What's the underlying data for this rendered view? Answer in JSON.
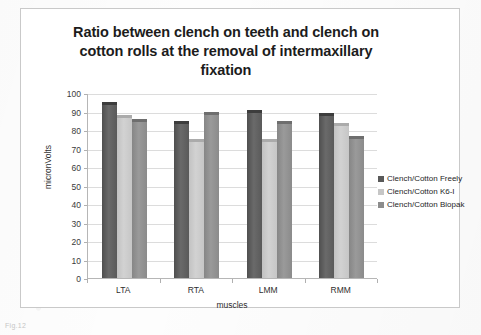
{
  "figure": {
    "caption": "Fig.12"
  },
  "chart_data": {
    "type": "bar",
    "title": "Ratio between clench on teeth and clench on cotton rolls at the removal of intermaxillary fixation",
    "title_lines": [
      "Ratio between clench on teeth and clench on",
      "cotton rolls at the removal of intermaxillary",
      "fixation"
    ],
    "xlabel": "muscles",
    "ylabel": "micronVolts",
    "categories": [
      "LTA",
      "RTA",
      "LMM",
      "RMM"
    ],
    "ylim": [
      0,
      100
    ],
    "ytick_step": 10,
    "yticks": [
      100,
      90,
      80,
      70,
      60,
      50,
      40,
      30,
      20,
      10,
      0
    ],
    "grid": true,
    "legend_position": "right",
    "series": [
      {
        "name": "Clench/Cotton Freely",
        "color": "#595959",
        "values": [
          95,
          85,
          91,
          89
        ]
      },
      {
        "name": "Clench/Cotton K6-I",
        "color": "#c6c6c6",
        "values": [
          88,
          75,
          75,
          84
        ]
      },
      {
        "name": "Clench/Cotton Biopak",
        "color": "#8c8c8c",
        "values": [
          86,
          90,
          85,
          77
        ]
      }
    ]
  }
}
